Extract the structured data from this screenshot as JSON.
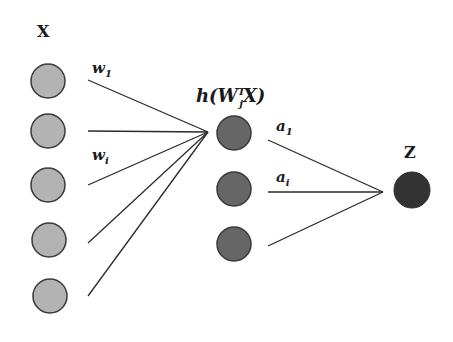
{
  "diagram": {
    "colors": {
      "background": "#ffffff",
      "input_node_fill": "#b3b3b3",
      "input_node_stroke": "#3a3a3a",
      "hidden_node_fill": "#666666",
      "hidden_node_stroke": "#3a3a3a",
      "output_node_fill": "#333333",
      "edge": "#2b2b2b"
    },
    "labels": {
      "input_layer": "X",
      "first_input_weight": "w",
      "first_input_weight_sub": "1",
      "ith_input_weight": "w",
      "ith_input_weight_sub": "i",
      "hidden_layer_fn": "h(W",
      "hidden_layer_fn_sup": "T",
      "hidden_layer_fn_sub": "j",
      "hidden_layer_fn_tail": "X)",
      "first_hidden_weight": "a",
      "first_hidden_weight_sub": "1",
      "ith_hidden_weight": "a",
      "ith_hidden_weight_sub": "i",
      "output": "Z"
    },
    "layers": {
      "input": {
        "count": 5,
        "node_label": "input-node"
      },
      "hidden": {
        "count": 3,
        "node_label": "hidden-node"
      },
      "output": {
        "count": 1,
        "node_label": "output-node"
      }
    }
  }
}
